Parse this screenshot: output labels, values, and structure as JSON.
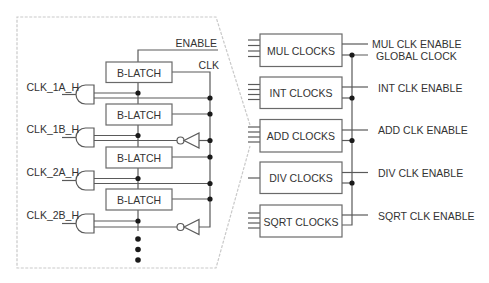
{
  "diagram": {
    "left_panel": {
      "enable_label": "ENABLE",
      "clk_label": "CLK",
      "latches": [
        {
          "label": "B-LATCH"
        },
        {
          "label": "B-LATCH"
        },
        {
          "label": "B-LATCH"
        },
        {
          "label": "B-LATCH"
        }
      ],
      "inputs": [
        {
          "label": "CLK_1A_H"
        },
        {
          "label": "CLK_1B_H"
        },
        {
          "label": "CLK_2A_H"
        },
        {
          "label": "CLK_2B_H"
        }
      ]
    },
    "right_panel": {
      "blocks": [
        {
          "label": "MUL CLOCKS",
          "output": "MUL CLK ENABLE"
        },
        {
          "label": "INT CLOCKS",
          "output": "INT CLK ENABLE"
        },
        {
          "label": "ADD CLOCKS",
          "output": "ADD CLK ENABLE"
        },
        {
          "label": "DIV CLOCKS",
          "output": "DIV CLK ENABLE"
        },
        {
          "label": "SQRT CLOCKS",
          "output": "SQRT CLK ENABLE"
        }
      ],
      "global_clock_label": "GLOBAL CLOCK"
    },
    "colors": {
      "wire": "#5a5a5a",
      "text": "#333333",
      "callout_border": "#c9c9c9",
      "junction_dot": "#1a1a1a"
    }
  }
}
